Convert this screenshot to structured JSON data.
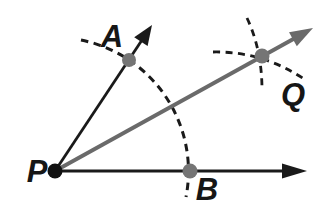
{
  "figure": {
    "kind": "geometry-construction-angle-bisector",
    "labels": {
      "vertex": "P",
      "upper_ray_point": "A",
      "lower_ray_point": "B",
      "bisector_point": "Q"
    },
    "colors": {
      "ray_stroke": "#1a1a1a",
      "bisector_stroke": "#6a6a6a",
      "arc_stroke": "#1a1a1a",
      "construction_dot": "#757575",
      "vertex_dot": "#111111",
      "background": "#ffffff"
    }
  }
}
